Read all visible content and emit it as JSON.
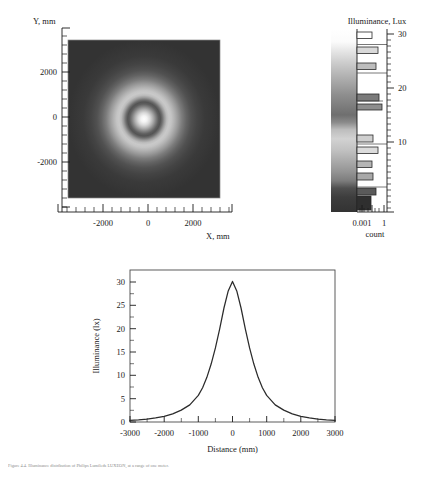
{
  "figure": {
    "caption": "Figure 4.4. Illuminance distribution of Philips Lumileds LUXEON, at a range of one meter."
  },
  "panel_map": {
    "yaxis_title": "Y, mm",
    "xaxis_title": "X, mm",
    "ytick_labels": [
      "2000",
      "0",
      "-2000"
    ],
    "ytick_values": [
      2000,
      0,
      -2000
    ],
    "xtick_labels": [
      "-2000",
      "0",
      "2000"
    ],
    "xtick_values": [
      -2000,
      0,
      2000
    ],
    "xlim": [
      -3000,
      3000
    ],
    "ylim": [
      -3000,
      3000
    ]
  },
  "panel_colorbar": {
    "title": "Illuminance, Lux",
    "count_axis_label": "count",
    "count_tick_labels": [
      "0.001",
      "1"
    ],
    "count_tick_values": [
      0.001,
      1
    ],
    "lux_tick_labels": [
      "30",
      "20",
      "10"
    ],
    "lux_tick_values": [
      30,
      20,
      10
    ],
    "lux_range": [
      0,
      31
    ],
    "count_range_log": [
      -4.2,
      0.55
    ]
  },
  "panel_profile": {
    "xlabel": "Distance (mm)",
    "ylabel": "Illuminance (lx)",
    "xtick_labels": [
      "-3000",
      "-2000",
      "-1000",
      "0",
      "1000",
      "2000",
      "3000"
    ],
    "xtick_values": [
      -3000,
      -2000,
      -1000,
      0,
      1000,
      2000,
      3000
    ],
    "ytick_labels": [
      "0",
      "5",
      "10",
      "15",
      "20",
      "25",
      "30"
    ],
    "ytick_values": [
      0,
      5,
      10,
      15,
      20,
      25,
      30
    ],
    "xlim": [
      -3000,
      3000
    ],
    "ylim": [
      0,
      32
    ]
  },
  "colors": {
    "ink": "#1a1a1a",
    "curve": "#2b2b2b",
    "frame": "#444444",
    "map_dark": "#2f2f2f",
    "map_bright": "#f2f2f2",
    "caption": "#8c8c8c"
  },
  "chart_data": [
    {
      "type": "heatmap",
      "title": "",
      "xlabel": "X, mm",
      "ylabel": "Y, mm",
      "xlim": [
        -3000,
        3000
      ],
      "ylim": [
        -3000,
        3000
      ],
      "colormap": "grayscale",
      "value_label": "Illuminance, Lux",
      "value_range": [
        0,
        31
      ],
      "description": "Radially symmetric illuminance map: bright core at origin (~30 lx), a darker annulus near r=800-1000 mm, a brighter ring r=1000-1800 mm, then falling to a dark background beyond r=2400 mm.",
      "radial_profile_r_mm": [
        0,
        200,
        400,
        600,
        800,
        1000,
        1200,
        1400,
        1600,
        1800,
        2000,
        2400,
        2800,
        3000
      ],
      "radial_profile_lux": [
        30.0,
        26.0,
        18.0,
        11.0,
        7.0,
        9.5,
        12.0,
        11.0,
        8.0,
        5.0,
        3.0,
        1.2,
        0.5,
        0.3
      ]
    },
    {
      "type": "bar",
      "orientation": "horizontal",
      "title": "Illuminance, Lux",
      "xlabel": "count",
      "ylabel": "Illuminance, Lux",
      "xscale": "log",
      "xlim": [
        7e-05,
        3.5
      ],
      "ylim": [
        0,
        31
      ],
      "categories": [
        "30.2",
        "27.6",
        "24.8",
        "22.2",
        "18.2",
        "16.3",
        "11.5",
        "9.4",
        "6.9",
        "4.8",
        "2.6",
        "1.3"
      ],
      "values": [
        0.0085,
        0.05,
        0.03,
        0.0,
        0.09,
        0.3,
        0.022,
        0.09,
        0.019,
        0.02,
        0.35,
        0.9
      ],
      "description": "Log-scale histogram of pixel counts per illuminance bin, drawn to the right of the grayscale colour bar."
    },
    {
      "type": "line",
      "title": "",
      "xlabel": "Distance (mm)",
      "ylabel": "Illuminance (lx)",
      "xlim": [
        -3000,
        3000
      ],
      "ylim": [
        0,
        32
      ],
      "x": [
        -3000,
        -2750,
        -2500,
        -2250,
        -2000,
        -1750,
        -1500,
        -1250,
        -1000,
        -875,
        -750,
        -625,
        -500,
        -375,
        -250,
        -125,
        0,
        125,
        250,
        375,
        500,
        625,
        750,
        875,
        1000,
        1250,
        1500,
        1750,
        2000,
        2250,
        2500,
        2750,
        3000
      ],
      "y": [
        0.35,
        0.45,
        0.6,
        0.85,
        1.2,
        1.7,
        2.5,
        3.6,
        5.6,
        7.2,
        9.4,
        12.2,
        15.6,
        19.6,
        24.0,
        27.6,
        29.6,
        27.6,
        24.0,
        19.6,
        15.6,
        12.2,
        9.4,
        7.2,
        5.6,
        3.6,
        2.5,
        1.7,
        1.2,
        0.85,
        0.6,
        0.45,
        0.35
      ]
    }
  ]
}
